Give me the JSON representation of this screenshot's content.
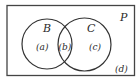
{
  "diagram": {
    "type": "venn",
    "universe_label": "P",
    "sets": [
      {
        "name": "set-b",
        "label": "B"
      },
      {
        "name": "set-c",
        "label": "C"
      }
    ],
    "regions": [
      {
        "name": "region-a",
        "label": "(a)"
      },
      {
        "name": "region-b",
        "label": "(b)"
      },
      {
        "name": "region-c",
        "label": "(c)"
      },
      {
        "name": "region-d",
        "label": "(d)"
      }
    ],
    "colors": {
      "stroke": "#333333",
      "background": "#ffffff"
    }
  }
}
